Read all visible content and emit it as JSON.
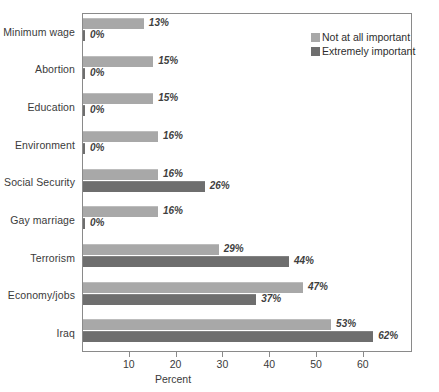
{
  "chart_data": {
    "type": "bar",
    "orientation": "horizontal",
    "title": "",
    "xlabel": "Percent",
    "ylabel": "",
    "xlim": [
      0,
      70.5
    ],
    "grid": false,
    "legend_position": "top-right",
    "xticks": [
      10,
      20,
      30,
      40,
      50,
      60
    ],
    "xtick_labels": [
      "10",
      "20",
      "30",
      "40",
      "50",
      "60"
    ],
    "categories": [
      "Minimum wage",
      "Abortion",
      "Education",
      "Environment",
      "Social Security",
      "Gay marriage",
      "Terrorism",
      "Economy/jobs",
      "Iraq"
    ],
    "series": [
      {
        "name": "Not at all important",
        "color": "#a8a8a8",
        "values": [
          13,
          15,
          15,
          16,
          16,
          16,
          29,
          47,
          53
        ],
        "labels": [
          "13%",
          "15%",
          "15%",
          "16%",
          "16%",
          "16%",
          "29%",
          "47%",
          "53%"
        ]
      },
      {
        "name": "Extremely important",
        "color": "#6e6e6e",
        "values": [
          0,
          0,
          0,
          0,
          26,
          0,
          44,
          37,
          62
        ],
        "labels": [
          "0%",
          "0%",
          "0%",
          "0%",
          "26%",
          "0%",
          "44%",
          "37%",
          "62%"
        ]
      }
    ]
  },
  "axis": {
    "x_title": "Percent"
  },
  "legend": {
    "items": [
      {
        "label": "Not at all important",
        "color": "#a8a8a8"
      },
      {
        "label": "Extremely important",
        "color": "#6e6e6e"
      }
    ]
  }
}
